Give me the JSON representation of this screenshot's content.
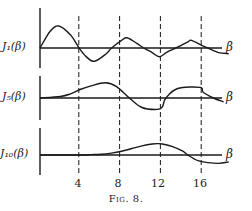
{
  "chart_data": {
    "type": "line",
    "title": "",
    "caption": "Fig. 8.",
    "xlabel": "β",
    "xticks": [
      4,
      8,
      12,
      16
    ],
    "xlim": [
      0,
      19
    ],
    "panels": [
      {
        "name": "J1(β)",
        "label": "J₁(β)",
        "axis_y": 48,
        "x": [
          0,
          1,
          1.84,
          3,
          3.83,
          4.5,
          5.33,
          6.5,
          7.02,
          8,
          8.54,
          9.5,
          10.17,
          11,
          11.71,
          12.5,
          13.32,
          14.5,
          14.86,
          16,
          16.47,
          17.5,
          18.5
        ],
        "y": [
          0,
          0.44,
          0.58,
          0.34,
          0,
          -0.22,
          -0.35,
          -0.15,
          0,
          0.2,
          0.27,
          0.12,
          0,
          -0.12,
          -0.23,
          -0.1,
          0,
          0.16,
          0.2,
          0.05,
          0,
          -0.12,
          -0.15
        ]
      },
      {
        "name": "J5(β)",
        "label": "J₅(β)",
        "axis_y": 98,
        "x": [
          0,
          2,
          3,
          4,
          5,
          6.42,
          7.5,
          8.77,
          10,
          11.5,
          12,
          12.34,
          13.5,
          15.7,
          16,
          17,
          18
        ],
        "y": [
          0,
          0.04,
          0.11,
          0.23,
          0.32,
          0.4,
          0.3,
          0,
          -0.25,
          -0.3,
          -0.23,
          0,
          0.25,
          0.28,
          0.15,
          0,
          -0.1
        ]
      },
      {
        "name": "J10(β)",
        "label": "J₁₀(β)",
        "axis_y": 155,
        "x": [
          0,
          4,
          5,
          6,
          7,
          8,
          9,
          10,
          11,
          11.5,
          12,
          13,
          14,
          14.48,
          15.5,
          16.5,
          17.5,
          18.5
        ],
        "y": [
          0,
          0,
          0.01,
          0.02,
          0.05,
          0.1,
          0.17,
          0.24,
          0.29,
          0.3,
          0.29,
          0.22,
          0.1,
          0,
          -0.15,
          -0.2,
          -0.22,
          -0.18
        ]
      }
    ],
    "legend": "none",
    "grid": "dashed vertical lines at β = 4, 8, 12, 16"
  },
  "labels": {
    "j1": "J₁(β)",
    "j5": "J₅(β)",
    "j10": "J₁₀(β)",
    "beta": "β",
    "ticks": [
      "4",
      "8",
      "12",
      "16"
    ],
    "caption": "Fig. 8."
  }
}
